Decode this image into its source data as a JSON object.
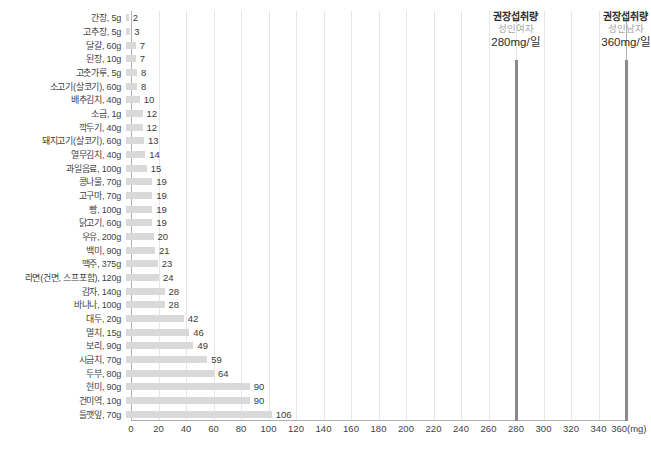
{
  "chart_data": {
    "type": "bar",
    "orientation": "horizontal",
    "title": "",
    "xlabel": "(mg)",
    "ylabel": "",
    "xlim": [
      0,
      360
    ],
    "xticks": [
      0,
      20,
      40,
      60,
      80,
      100,
      120,
      140,
      160,
      180,
      200,
      220,
      240,
      260,
      280,
      300,
      320,
      340,
      360
    ],
    "xtick_labels": [
      "0",
      "20",
      "40",
      "60",
      "80",
      "100",
      "120",
      "140",
      "160",
      "180",
      "200",
      "220",
      "240",
      "260",
      "280",
      "300",
      "320",
      "340",
      "360(mg)"
    ],
    "grid": true,
    "legend": "none",
    "bar_color": "#d9d9d9",
    "categories": [
      "간장, 5g",
      "고추장, 5g",
      "달걀, 60g",
      "된장, 10g",
      "고춧가루, 5g",
      "소고기(살코기), 60g",
      "배추김치, 40g",
      "소금, 1g",
      "깍두기, 40g",
      "돼지고기(살코기), 60g",
      "열무김치, 40g",
      "과일음료, 100g",
      "콩나물, 70g",
      "고구마, 70g",
      "빵, 100g",
      "닭고기, 60g",
      "우유, 200g",
      "백미, 90g",
      "맥주, 375g",
      "라면(건면, 스프포함), 120g",
      "감자, 140g",
      "바나나, 100g",
      "대두, 20g",
      "멸치, 15g",
      "보리, 90g",
      "시금치, 70g",
      "두부, 80g",
      "현미, 90g",
      "건미역, 10g",
      "들깻잎, 70g"
    ],
    "values": [
      2,
      3,
      7,
      7,
      8,
      8,
      10,
      12,
      12,
      13,
      14,
      15,
      19,
      19,
      19,
      19,
      20,
      21,
      23,
      24,
      28,
      28,
      42,
      46,
      49,
      59,
      64,
      90,
      90,
      106
    ],
    "annotations": [
      {
        "name": "recommended-intake-female",
        "title": "권장섭취량",
        "subtitle": "성인여자",
        "amount": "280mg/일",
        "value": 280,
        "line_color": "#8a8a8a"
      },
      {
        "name": "recommended-intake-male",
        "title": "권장섭취량",
        "subtitle": "성인남자",
        "amount": "360mg/일",
        "value": 360,
        "line_color": "#8a8a8a"
      }
    ]
  }
}
